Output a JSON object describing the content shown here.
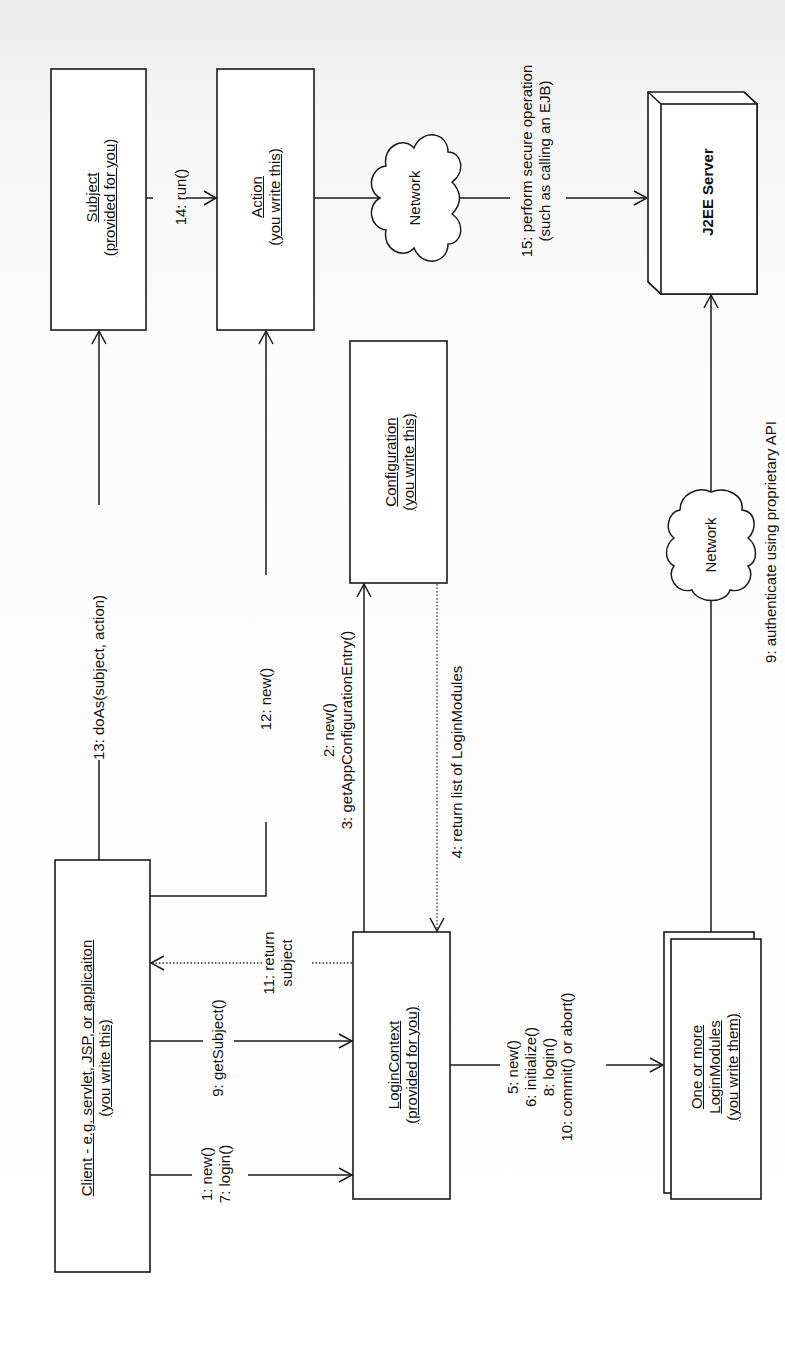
{
  "diagram": {
    "type": "UML collaboration diagram (JAAS authentication)",
    "orientation": "rotated 90deg counter-clockwise",
    "objects": {
      "subject": {
        "name": "Subject",
        "note": "(provided for you)"
      },
      "action": {
        "name": "Action",
        "note": "(you write this)"
      },
      "configuration": {
        "name": "Configuration",
        "note": "(you write this)"
      },
      "client": {
        "name": "Client - e.g. servlet, JSP, or applicaiton",
        "note": "(you write this)"
      },
      "login_context": {
        "name": "LoginContext",
        "note": "(provided for you)"
      },
      "login_modules": {
        "line1": "One or more",
        "name": "LoginModules",
        "note": "(you write them)"
      },
      "j2ee_server": {
        "name": "J2EE Server"
      },
      "network_top": {
        "name": "Network"
      },
      "network_right": {
        "name": "Network"
      }
    },
    "messages": {
      "m14": "14: run()",
      "m15_line1": "15: perform secure operation",
      "m15_line2": "(such as calling an EJB)",
      "m13": "13:  doAs(subject, action)",
      "m12": "12: new()",
      "m2": "2: new()",
      "m3": "3: getAppConfigurationEntry()",
      "m4": "4: return list of LoginModules",
      "m11_line1": "11: return",
      "m11_line2": "subject",
      "m9_get": "9: getSubject()",
      "m1": "1: new()",
      "m7": "7: login()",
      "m5": "5: new()",
      "m6": "6: initialize()",
      "m8": "8: login()",
      "m10": "10: commit() or abort()",
      "m9_auth": "9: authenticate using proprietary API"
    }
  }
}
